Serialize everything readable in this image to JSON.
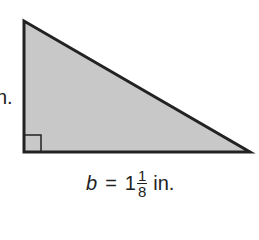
{
  "figure": {
    "shape": "right-triangle",
    "fill_color": "#c8c8c8",
    "stroke_color": "#222222",
    "vertices": [
      [
        24,
        21
      ],
      [
        24,
        152
      ],
      [
        250,
        152
      ]
    ],
    "right_angle_marker": {
      "x": 24,
      "y": 135,
      "size": 17
    }
  },
  "labels": {
    "height_label": "n.",
    "base": {
      "variable": "b",
      "equals": "=",
      "whole": "1",
      "numerator": "1",
      "denominator": "8",
      "unit": "in."
    }
  }
}
